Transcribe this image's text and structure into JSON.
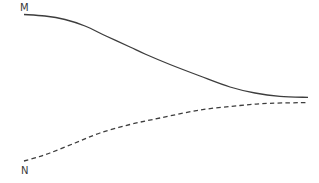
{
  "diagram": {
    "background_color": "#ffffff",
    "stroke_color": "#3d3d3d",
    "stroke_width": 1.3,
    "dash_pattern": "4.5 3.2",
    "label_color": "#3a3a3a",
    "curves": [
      {
        "label": "M",
        "style": "solid",
        "label_pos": [
          20,
          3
        ],
        "points": [
          [
            24,
            14.5
          ],
          [
            45,
            16
          ],
          [
            65,
            19.5
          ],
          [
            85,
            26
          ],
          [
            106,
            36
          ],
          [
            130,
            47
          ],
          [
            145,
            54
          ],
          [
            170,
            64.5
          ],
          [
            200,
            76
          ],
          [
            230,
            87
          ],
          [
            255,
            93
          ],
          [
            280,
            96.3
          ],
          [
            308,
            97.4
          ]
        ]
      },
      {
        "label": "N",
        "style": "dashed",
        "label_pos": [
          21,
          166
        ],
        "points": [
          [
            24,
            161
          ],
          [
            38,
            157
          ],
          [
            50,
            153
          ],
          [
            75,
            143
          ],
          [
            100,
            133
          ],
          [
            130,
            124.5
          ],
          [
            160,
            118
          ],
          [
            200,
            110
          ],
          [
            240,
            105.5
          ],
          [
            270,
            103.3
          ],
          [
            307,
            102.6
          ]
        ]
      }
    ]
  }
}
